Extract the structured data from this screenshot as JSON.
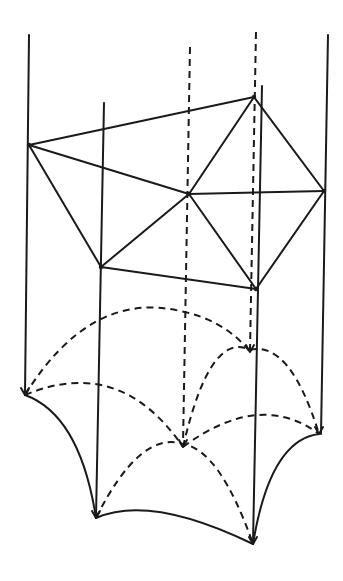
{
  "diagram": {
    "title": "",
    "colors": {
      "background": "#ffffff",
      "ink": "#1a1a1a"
    },
    "plan_vertices": {
      "left": [
        29,
        145
      ],
      "top_right": [
        254,
        97
      ],
      "center": [
        189,
        194
      ],
      "right": [
        324,
        191
      ],
      "bottom_left": [
        101,
        267
      ],
      "bottom_right": [
        256,
        289
      ]
    },
    "plan_edges": [
      [
        "left",
        "top_right"
      ],
      [
        "left",
        "center"
      ],
      [
        "left",
        "bottom_left"
      ],
      [
        "top_right",
        "center"
      ],
      [
        "top_right",
        "right"
      ],
      [
        "center",
        "right"
      ],
      [
        "center",
        "bottom_left"
      ],
      [
        "center",
        "bottom_right"
      ],
      [
        "bottom_left",
        "bottom_right"
      ],
      [
        "right",
        "bottom_right"
      ]
    ],
    "solid_verticals": [
      {
        "x1": 29,
        "y1": 35,
        "x2": 25,
        "y2": 395
      },
      {
        "x1": 104,
        "y1": 103,
        "x2": 96,
        "y2": 518
      },
      {
        "x1": 262,
        "y1": 86,
        "x2": 253,
        "y2": 544
      },
      {
        "x1": 328,
        "y1": 35,
        "x2": 321,
        "y2": 434
      }
    ],
    "dashed_verticals": [
      {
        "x1": 190,
        "y1": 47,
        "x2": 183,
        "y2": 445
      },
      {
        "x1": 256,
        "y1": 32,
        "x2": 250,
        "y2": 350
      }
    ],
    "solid_curves": [
      "M25,395 Q80,415 96,518",
      "M96,518 Q150,494 253,544",
      "M253,544 Q270,440 319,434"
    ],
    "dashed_curves": [
      "M25,395 Q90,290 180,311 Q225,320 250,352",
      "M25,395 Q120,355 183,447",
      "M96,518 Q140,430 183,444 Q220,450 253,544",
      "M183,447 Q210,330 250,350 Q290,340 319,434",
      "M183,447 Q260,390 319,434"
    ],
    "arrow_tips": [
      [
        25,
        395
      ],
      [
        96,
        518
      ],
      [
        183,
        447
      ],
      [
        250,
        352
      ],
      [
        253,
        544
      ],
      [
        319,
        434
      ]
    ]
  }
}
